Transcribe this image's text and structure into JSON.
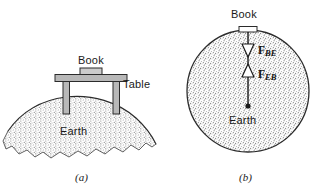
{
  "figure": {
    "width": 325,
    "height": 194,
    "background": "#ffffff",
    "ink_color": "#1a1a1a",
    "stipple_color": "#8c8c8c",
    "table_fill": "#b8b8b8",
    "book_fill": "#cccccc"
  },
  "panel_a": {
    "caption": "(a)",
    "labels": {
      "book": "Book",
      "table": "Table",
      "earth": "Earth"
    }
  },
  "panel_b": {
    "caption": "(b)",
    "labels": {
      "book": "Book",
      "earth": "Earth"
    },
    "forces": [
      {
        "symbol": "F",
        "subscript": "BE",
        "direction": "down",
        "arrowhead": "hollow-triangle",
        "description": "force on Book from Earth"
      },
      {
        "symbol": "F",
        "subscript": "EB",
        "direction": "up",
        "arrowhead": "hollow-triangle",
        "description": "force on Earth from Book"
      }
    ]
  }
}
